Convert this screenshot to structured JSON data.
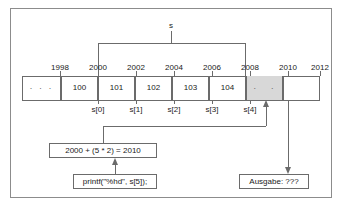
{
  "figure": {
    "pointer_label": "s",
    "line_color": "#6b6b6b",
    "shade_color": "#d8d8d8",
    "frame_color": "#8c8c8c"
  },
  "memory": {
    "addresses": [
      "1998",
      "2000",
      "2002",
      "2004",
      "2006",
      "2008",
      "2010",
      "2012"
    ],
    "cells": [
      {
        "value": "·  ·  ·",
        "index": "",
        "shaded": false
      },
      {
        "value": "100",
        "index": "s[0]",
        "shaded": false
      },
      {
        "value": "101",
        "index": "s[1]",
        "shaded": false
      },
      {
        "value": "102",
        "index": "s[2]",
        "shaded": false
      },
      {
        "value": "103",
        "index": "s[3]",
        "shaded": false
      },
      {
        "value": "104",
        "index": "s[4]",
        "shaded": false
      },
      {
        "value": "·",
        "index": "",
        "shaded": true
      },
      {
        "value": "·",
        "index": "",
        "shaded": true
      },
      {
        "value": "",
        "index": "",
        "shaded": false
      }
    ]
  },
  "callouts": {
    "calc": "2000 + (5 * 2) = 2010",
    "printf": "printf(\"%hd\", s[5]);",
    "ausgabe": "Ausgabe: ???"
  }
}
